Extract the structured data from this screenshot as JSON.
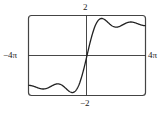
{
  "chart_data": {
    "type": "line",
    "title": "",
    "xlabel": "",
    "ylabel": "",
    "function": "Si(x) = integral from 0 to x of sin(t)/t dt",
    "xlim": [
      -12.566,
      12.566
    ],
    "ylim": [
      -2,
      2
    ],
    "tick_labels": {
      "x_min": "−4π",
      "x_max": "4π",
      "y_max": "2",
      "y_min": "−2"
    },
    "grid": false,
    "legend": null,
    "series": [
      {
        "name": "Si(x)",
        "x": [
          -12.566,
          -10.996,
          -9.425,
          -7.854,
          -6.283,
          -4.712,
          -3.142,
          -1.571,
          0,
          1.571,
          3.142,
          4.712,
          6.283,
          7.854,
          9.425,
          10.996,
          12.566
        ],
        "y": [
          -1.492,
          -1.664,
          -1.475,
          -1.698,
          -1.418,
          -1.778,
          -1.852,
          -1.371,
          0,
          1.371,
          1.852,
          1.778,
          1.418,
          1.698,
          1.475,
          1.664,
          1.492
        ]
      }
    ]
  },
  "labels": {
    "y_max": "2",
    "y_min": "−2",
    "x_min": "−4π",
    "x_max": "4π"
  },
  "colors": {
    "curve": "#222222",
    "axes": "#333333",
    "frame": "#444444"
  }
}
